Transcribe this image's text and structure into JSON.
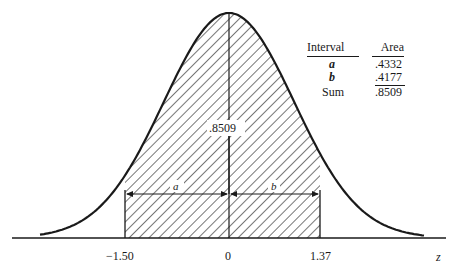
{
  "chart_data": {
    "type": "area",
    "xlabel": "z",
    "ylabel": "",
    "x_ticks": [
      "-1.50",
      "0",
      "1.37"
    ],
    "shaded_region": {
      "from": -1.5,
      "to": 1.37,
      "area": ".8509"
    },
    "intervals": [
      {
        "name": "a",
        "from": -1.5,
        "to": 0,
        "area": ".4332"
      },
      {
        "name": "b",
        "from": 0,
        "to": 1.37,
        "area": ".4177"
      }
    ],
    "grid": false
  },
  "diagram": {
    "center_label": ".8509",
    "interval_a_label": "a",
    "interval_b_label": "b",
    "axis_label": "z",
    "ticks": {
      "left": "−1.50",
      "center": "0",
      "right": "1.37"
    }
  },
  "table": {
    "headers": {
      "interval": "Interval",
      "area": "Area"
    },
    "rows": [
      {
        "interval": "a",
        "area": ".4332"
      },
      {
        "interval": "b",
        "area": ".4177"
      },
      {
        "interval": "Sum",
        "area": ".8509"
      }
    ]
  }
}
